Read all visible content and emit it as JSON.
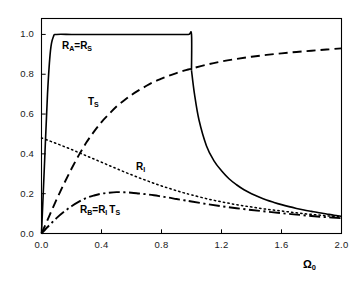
{
  "figure": {
    "background": "#ffffff",
    "foreground": "#000000"
  },
  "axes": {
    "x_label": "Ω",
    "x_label_sub": "0",
    "x_ticks": [
      "0.0",
      "0.4",
      "0.8",
      "1.2",
      "1.6",
      "2.0"
    ],
    "x_tick_values": [
      0.0,
      0.4,
      0.8,
      1.2,
      1.6,
      2.0
    ],
    "y_ticks": [
      "0.0",
      "0.2",
      "0.4",
      "0.6",
      "0.8",
      "1.0"
    ],
    "y_tick_values": [
      0.0,
      0.2,
      0.4,
      0.6,
      0.8,
      1.0
    ],
    "xlim": [
      0.0,
      2.0
    ],
    "ylim": [
      0.0,
      1.08
    ],
    "frame": true,
    "grid": false
  },
  "annotations": [
    {
      "name": "label-ra-rs",
      "base1": "R",
      "sub1": "A",
      "mid": "=",
      "base2": "R",
      "sub2": "S",
      "x_px": 62,
      "y_px": 40
    },
    {
      "name": "label-ts",
      "base1": "T",
      "sub1": "S",
      "mid": "",
      "base2": "",
      "sub2": "",
      "x_px": 88,
      "y_px": 96
    },
    {
      "name": "label-ri",
      "base1": "R",
      "sub1": "I",
      "mid": "",
      "base2": "",
      "sub2": "",
      "x_px": 136,
      "y_px": 161
    },
    {
      "name": "label-rb",
      "base1": "R",
      "sub1": "B",
      "mid": "=",
      "base2": "R",
      "sub2": "I",
      "x_px": 80,
      "y_px": 204,
      "tail_base": "T",
      "tail_sub": "S"
    }
  ],
  "chart_data": {
    "type": "line",
    "title": "",
    "xlabel": "Ω₀",
    "ylabel": "",
    "xlim": [
      0.0,
      2.0
    ],
    "ylim": [
      0.0,
      1.08
    ],
    "grid": false,
    "legend": "inline-annotations",
    "series": [
      {
        "name": "R_A=R_S",
        "label": "R_A=R_S",
        "style": "solid",
        "color": "#000000",
        "width": 1.6,
        "x": [
          0.0,
          0.02,
          0.04,
          0.06,
          0.08,
          0.1,
          0.2,
          0.3,
          0.4,
          0.5,
          0.6,
          0.7,
          0.8,
          0.9,
          0.98,
          1.0,
          1.0,
          1.02,
          1.05,
          1.1,
          1.15,
          1.2,
          1.25,
          1.3,
          1.35,
          1.4,
          1.45,
          1.5,
          1.55,
          1.6,
          1.65,
          1.7,
          1.75,
          1.8,
          1.85,
          1.9,
          1.95,
          2.0
        ],
        "y": [
          0.0,
          0.35,
          0.7,
          0.92,
          0.99,
          1.0,
          1.0,
          1.0,
          1.0,
          1.0,
          1.0,
          1.0,
          1.0,
          1.0,
          1.0,
          1.0,
          0.82,
          0.7,
          0.57,
          0.44,
          0.365,
          0.315,
          0.275,
          0.245,
          0.22,
          0.2,
          0.183,
          0.168,
          0.156,
          0.145,
          0.135,
          0.126,
          0.118,
          0.111,
          0.104,
          0.098,
          0.092,
          0.087
        ]
      },
      {
        "name": "T_S",
        "label": "T_S",
        "style": "dashed",
        "color": "#000000",
        "width": 1.9,
        "x": [
          0.0,
          0.05,
          0.1,
          0.15,
          0.2,
          0.25,
          0.3,
          0.35,
          0.4,
          0.45,
          0.5,
          0.55,
          0.6,
          0.65,
          0.7,
          0.75,
          0.8,
          0.85,
          0.9,
          0.95,
          1.0,
          1.1,
          1.2,
          1.3,
          1.4,
          1.5,
          1.6,
          1.7,
          1.8,
          1.9,
          2.0
        ],
        "y": [
          0.0,
          0.085,
          0.17,
          0.25,
          0.325,
          0.395,
          0.458,
          0.512,
          0.56,
          0.6,
          0.638,
          0.668,
          0.696,
          0.72,
          0.742,
          0.762,
          0.778,
          0.793,
          0.806,
          0.818,
          0.828,
          0.848,
          0.864,
          0.877,
          0.888,
          0.897,
          0.905,
          0.912,
          0.918,
          0.924,
          0.93
        ]
      },
      {
        "name": "R_I",
        "label": "R_I",
        "style": "dotted",
        "color": "#000000",
        "width": 1.5,
        "x": [
          0.0,
          0.05,
          0.1,
          0.15,
          0.2,
          0.25,
          0.3,
          0.35,
          0.4,
          0.45,
          0.5,
          0.55,
          0.6,
          0.65,
          0.7,
          0.75,
          0.8,
          0.85,
          0.9,
          0.95,
          1.0,
          1.1,
          1.2,
          1.3,
          1.4,
          1.5,
          1.6,
          1.7,
          1.8,
          1.9,
          2.0
        ],
        "y": [
          0.48,
          0.466,
          0.452,
          0.437,
          0.422,
          0.406,
          0.39,
          0.374,
          0.358,
          0.342,
          0.326,
          0.31,
          0.295,
          0.28,
          0.266,
          0.252,
          0.239,
          0.227,
          0.215,
          0.204,
          0.194,
          0.175,
          0.159,
          0.145,
          0.133,
          0.122,
          0.113,
          0.104,
          0.096,
          0.089,
          0.083
        ]
      },
      {
        "name": "R_B=R_I T_S",
        "label": "R_B=R_I T_S",
        "style": "dashdot",
        "color": "#000000",
        "width": 1.9,
        "x": [
          0.0,
          0.05,
          0.1,
          0.15,
          0.2,
          0.25,
          0.3,
          0.35,
          0.4,
          0.45,
          0.5,
          0.55,
          0.6,
          0.65,
          0.7,
          0.75,
          0.8,
          0.85,
          0.9,
          0.95,
          1.0,
          1.1,
          1.2,
          1.3,
          1.4,
          1.5,
          1.6,
          1.7,
          1.8,
          1.9,
          2.0
        ],
        "y": [
          0.0,
          0.04,
          0.077,
          0.109,
          0.137,
          0.16,
          0.179,
          0.191,
          0.2,
          0.205,
          0.208,
          0.207,
          0.205,
          0.201,
          0.197,
          0.192,
          0.186,
          0.18,
          0.173,
          0.167,
          0.161,
          0.148,
          0.137,
          0.127,
          0.118,
          0.11,
          0.102,
          0.095,
          0.088,
          0.082,
          0.077
        ]
      }
    ]
  }
}
